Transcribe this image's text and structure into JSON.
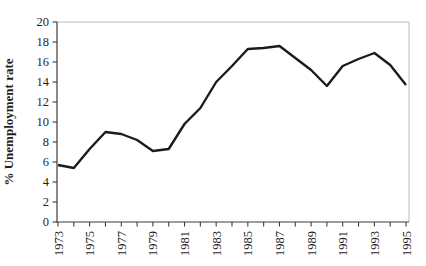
{
  "chart_data": {
    "type": "line",
    "title": "",
    "xlabel": "",
    "ylabel": "% Unemployment rate",
    "x": [
      1973,
      1974,
      1975,
      1976,
      1977,
      1978,
      1979,
      1980,
      1981,
      1982,
      1983,
      1984,
      1985,
      1986,
      1987,
      1988,
      1989,
      1990,
      1991,
      1992,
      1993,
      1994,
      1995
    ],
    "values": [
      5.7,
      5.4,
      7.3,
      9.0,
      8.8,
      8.2,
      7.1,
      7.3,
      9.8,
      11.4,
      14.0,
      15.6,
      17.3,
      17.4,
      17.6,
      16.4,
      15.2,
      13.6,
      15.6,
      16.3,
      16.9,
      15.7,
      13.7
    ],
    "ylim": [
      0,
      20
    ],
    "ytick_step": 2,
    "y_tick_labels": [
      "0",
      "2",
      "4",
      "6",
      "8",
      "10",
      "12",
      "14",
      "16",
      "18",
      "20"
    ],
    "x_tick_labels": [
      "1973",
      "1975",
      "1977",
      "1979",
      "1981",
      "1983",
      "1985",
      "1987",
      "1989",
      "1991",
      "1993",
      "1995"
    ],
    "x_minor_tick_every_year": true,
    "grid": false,
    "legend": "none",
    "line_color": "#1b1b1b",
    "axis_color": "#3d3d3d",
    "frame_color": "#b9b9b9",
    "background": "#ffffff"
  }
}
